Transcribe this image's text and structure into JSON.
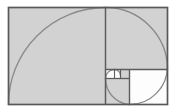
{
  "figure": {
    "title": "Fibonacci golden spiral in golden rectangle",
    "type": "geometric-diagram",
    "canvas": {
      "width": 177,
      "height": 112
    },
    "colors": {
      "background": "#ffffff",
      "fill_gray": "#d2d2d2",
      "fill_white": "#fdfdfd",
      "stroke_outline": "#595959",
      "stroke_divider": "#5c5c5c",
      "stroke_spiral": "#8a8a8a"
    },
    "stroke_widths": {
      "outline": 1.6,
      "divider": 1.4,
      "divider_small": 1.1,
      "spiral": 1.3
    },
    "outer_rectangle": {
      "label": "golden rectangle",
      "x": 8.5,
      "y": 7.5,
      "width": 159,
      "height": 97
    },
    "squares": [
      {
        "name": "square-1-largest",
        "x": 8.5,
        "y": 7.5,
        "size": 97,
        "fill": "gray",
        "arc_from": "bottom-left",
        "arc_to": "top-right"
      },
      {
        "name": "square-2",
        "x": 105.5,
        "y": 7.5,
        "size": 62,
        "fill": "gray",
        "arc_from": "top-left",
        "arc_to": "bottom-right"
      },
      {
        "name": "square-3",
        "x": 129.5,
        "y": 69.5,
        "size": 38,
        "fill": "white",
        "arc_from": "bottom-left",
        "arc_to": "top-right"
      },
      {
        "name": "square-4",
        "x": 105.5,
        "y": 78.5,
        "size": 24,
        "fill": "gray",
        "arc_from": "top-right",
        "arc_to": "bottom-left"
      },
      {
        "name": "square-5",
        "x": 105.5,
        "y": 69.5,
        "size": 9,
        "fill": "white",
        "arc_from": "bottom-right",
        "arc_to": "top-left"
      },
      {
        "name": "square-6",
        "x": 120.5,
        "y": 69.5,
        "size": 9,
        "fill": "gray",
        "arc_from": "bottom-left",
        "arc_to": "top-right"
      }
    ],
    "divider_lines": [
      {
        "name": "divider-vertical-main",
        "x1": 105.5,
        "y1": 7.5,
        "x2": 105.5,
        "y2": 104.5
      },
      {
        "name": "divider-horizontal-main",
        "x1": 105.5,
        "y1": 69.5,
        "x2": 167.5,
        "y2": 69.5
      },
      {
        "name": "divider-vertical-second",
        "x1": 129.5,
        "y1": 69.5,
        "x2": 129.5,
        "y2": 104.5
      },
      {
        "name": "divider-horizontal-3rd",
        "x1": 105.5,
        "y1": 78.5,
        "x2": 129.5,
        "y2": 78.5
      },
      {
        "name": "divider-vertical-small",
        "x1": 120.5,
        "y1": 69.5,
        "x2": 120.5,
        "y2": 78.5
      },
      {
        "name": "divider-horizontal-tiny",
        "x1": 114.5,
        "y1": 69.5,
        "x2": 114.5,
        "y2": 78.5
      }
    ],
    "spiral_arcs": [
      {
        "name": "arc-1-largest",
        "path": "M 8.5 104.5 A 97 97 0 0 1 105.5 7.5"
      },
      {
        "name": "arc-2",
        "path": "M 105.5 7.5 A 62 62 0 0 1 167.5 69.5"
      },
      {
        "name": "arc-3",
        "path": "M 167.5 69.5 A 38 38 0 0 1 129.5 104.5"
      },
      {
        "name": "arc-4",
        "path": "M 129.5 104.5 A 24 24 0 0 1 105.5 78.5"
      },
      {
        "name": "arc-5",
        "path": "M 105.5 78.5 A 9 9 0 0 1 114.5 69.5"
      },
      {
        "name": "arc-6-smallest",
        "path": "M 114.5 69.5 A 6 6 0 0 1 120.5 75.5"
      }
    ]
  }
}
